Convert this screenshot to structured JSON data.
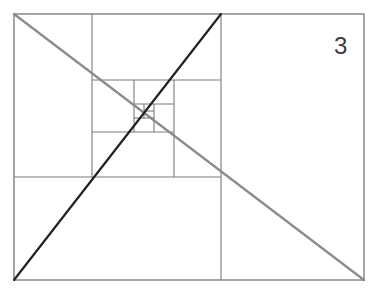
{
  "figure": {
    "label": "3"
  },
  "colors": {
    "background": "#ffffff",
    "grid_line": "#7a7a7a",
    "frame": "#808080",
    "diagonal_dark": "#222222",
    "diagonal_gray": "#8a8a8a",
    "label_text": "#3a3a3a"
  },
  "frame": {
    "x1": 14,
    "y1": 14,
    "x2": 364,
    "y2": 280
  },
  "grid_lines": [
    {
      "id": "main-vertical",
      "x1": 221,
      "y1": 14,
      "x2": 221,
      "y2": 280
    },
    {
      "id": "left-horizontal",
      "x1": 14,
      "y1": 177,
      "x2": 221,
      "y2": 177
    },
    {
      "id": "upper-left-vertical",
      "x1": 92,
      "y1": 14,
      "x2": 92,
      "y2": 177
    },
    {
      "id": "top-horizontal",
      "x1": 92,
      "y1": 80,
      "x2": 221,
      "y2": 80
    },
    {
      "id": "right-inner-vertical",
      "x1": 174,
      "y1": 80,
      "x2": 174,
      "y2": 177
    },
    {
      "id": "mid-horizontal",
      "x1": 92,
      "y1": 132,
      "x2": 174,
      "y2": 132
    },
    {
      "id": "inner-left-vertical",
      "x1": 134,
      "y1": 80,
      "x2": 134,
      "y2": 132
    },
    {
      "id": "inner-top-horizontal",
      "x1": 134,
      "y1": 104,
      "x2": 174,
      "y2": 104
    },
    {
      "id": "inner-right-vertical",
      "x1": 154,
      "y1": 104,
      "x2": 154,
      "y2": 132
    },
    {
      "id": "small-horizontal",
      "x1": 134,
      "y1": 118,
      "x2": 154,
      "y2": 118
    },
    {
      "id": "small-vertical",
      "x1": 144,
      "y1": 104,
      "x2": 144,
      "y2": 118
    },
    {
      "id": "tiny-horizontal",
      "x1": 144,
      "y1": 111,
      "x2": 154,
      "y2": 111
    }
  ],
  "diagonals": [
    {
      "id": "dark-diagonal",
      "x1": 14,
      "y1": 280,
      "x2": 221,
      "y2": 14,
      "color_key": "diagonal_dark",
      "width": 2.2
    },
    {
      "id": "gray-diagonal",
      "x1": 14,
      "y1": 14,
      "x2": 364,
      "y2": 280,
      "color_key": "diagonal_gray",
      "width": 2.2
    }
  ]
}
